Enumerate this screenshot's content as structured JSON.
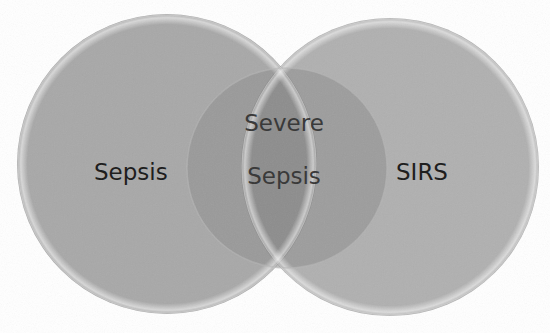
{
  "diagram": {
    "type": "venn",
    "sets": [
      {
        "id": "sepsis",
        "label": "Sepsis",
        "cx": 167,
        "cy": 164,
        "r": 150,
        "fill": "#a8a8a8"
      },
      {
        "id": "sirs",
        "label": "SIRS",
        "cx": 390,
        "cy": 167,
        "r": 149,
        "fill": "#a9a9a9"
      },
      {
        "id": "severe-sepsis",
        "label_line1": "Severe",
        "label_line2": "Sepsis",
        "cx": 287,
        "cy": 168,
        "r": 100,
        "fill": "#8e8e8e"
      }
    ],
    "colors": {
      "background": "#ffffff",
      "outer_circle": "#a8a8a8",
      "overlap": "#8c8c8c",
      "text": "#1e1e1e"
    }
  }
}
